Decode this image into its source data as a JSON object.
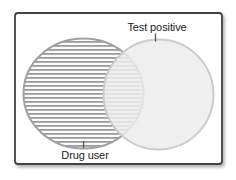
{
  "figure": {
    "type": "venn-diagram",
    "sets": [
      {
        "id": "drug-user",
        "label": "Drug user",
        "fill_style": "horizontal-stripes",
        "position": "left",
        "label_position": "below-circle"
      },
      {
        "id": "test-positive",
        "label": "Test positive",
        "fill_style": "solid-light-gray",
        "position": "right",
        "label_position": "above-circle"
      }
    ]
  },
  "colors": {
    "box_border": "#424242",
    "left_circle_stroke": "#a0a0a0",
    "stripe": "#9c9c9c",
    "stripe_bg": "#fbfbfb",
    "right_circle_fill": "#ececec",
    "right_circle_stroke": "#cbcbcb",
    "label_text": "#222222",
    "tick": "#555555",
    "shadow": "#777777"
  }
}
